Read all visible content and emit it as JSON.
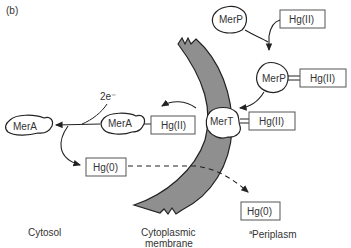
{
  "figure_label": "(b)",
  "electrons_label": "2e⁻",
  "nodes": {
    "merp_free": "MerP",
    "hg2_top": "Hg(II)",
    "merp_bound": "MerP",
    "hg2_merp": "Hg(II)",
    "mert": "MerT",
    "hg2_mert": "Hg(II)",
    "mera_bound": "MerA",
    "hg2_mera": "Hg(II)",
    "mera_free": "MerA",
    "hg0_cytosol": "Hg(0)",
    "hg0_periplasm": "Hg(0)"
  },
  "regions": {
    "cytosol": "Cytosol",
    "membrane_line1": "Cytoplasmic",
    "membrane_line2": "membrane",
    "periplasm_sup": "a",
    "periplasm": "Periplasm"
  },
  "colors": {
    "membrane_fill": "#8f8f8f",
    "stroke": "#222222",
    "text": "#333333"
  }
}
